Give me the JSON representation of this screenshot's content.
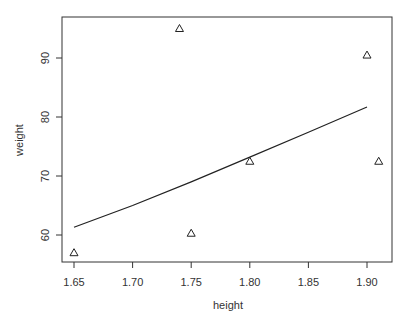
{
  "chart_data": {
    "type": "scatter",
    "title": "",
    "xlabel": "height",
    "ylabel": "weight",
    "xlim": [
      1.64,
      1.92
    ],
    "ylim": [
      55.5,
      96.5
    ],
    "x_ticks": [
      1.65,
      1.7,
      1.75,
      1.8,
      1.85,
      1.9
    ],
    "x_tick_labels": [
      "1.65",
      "1.70",
      "1.75",
      "1.80",
      "1.85",
      "1.90"
    ],
    "y_ticks": [
      60,
      70,
      80,
      90
    ],
    "y_tick_labels": [
      "60",
      "70",
      "80",
      "90"
    ],
    "grid": false,
    "legend": null,
    "series": [
      {
        "name": "observations",
        "type": "scatter",
        "marker": "triangle-open",
        "x": [
          1.65,
          1.74,
          1.75,
          1.8,
          1.9,
          1.91
        ],
        "y": [
          57.0,
          95.0,
          60.3,
          72.5,
          90.5,
          72.5
        ]
      },
      {
        "name": "fitted curve",
        "type": "line",
        "x": [
          1.65,
          1.7,
          1.75,
          1.8,
          1.85,
          1.9
        ],
        "y": [
          61.3,
          65.0,
          69.0,
          73.2,
          77.4,
          81.7
        ]
      }
    ]
  },
  "colors": {
    "axis": "#333333",
    "points": "#222222",
    "line": "#222222",
    "background": "#ffffff"
  }
}
